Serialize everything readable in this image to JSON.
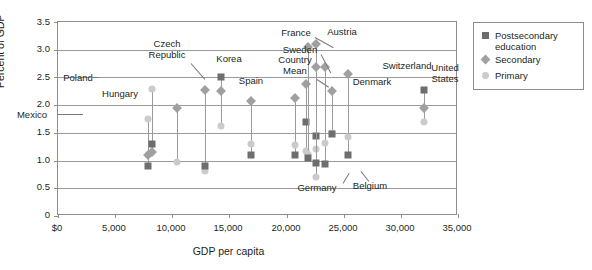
{
  "chart_data": {
    "type": "scatter",
    "title": "",
    "xlabel": "GDP per capita",
    "ylabel": "Percent of GDP",
    "xlim": [
      0,
      35000
    ],
    "ylim": [
      0,
      3.5
    ],
    "xticks": [
      "$0",
      "5,000",
      "10,000",
      "15,000",
      "20,000",
      "25,000",
      "30,000",
      "35,000"
    ],
    "xtick_values": [
      0,
      5000,
      10000,
      15000,
      20000,
      25000,
      30000,
      35000
    ],
    "yticks": [
      "0",
      "0.5",
      "1.0",
      "1.5",
      "2.0",
      "2.5",
      "3.0",
      "3.5"
    ],
    "ytick_values": [
      0,
      0.5,
      1.0,
      1.5,
      2.0,
      2.5,
      3.0,
      3.5
    ],
    "grid": true,
    "legend_position": "right",
    "series": [
      {
        "name": "Postsecondary education",
        "marker": "square",
        "color": "#6e6e6e"
      },
      {
        "name": "Secondary",
        "marker": "diamond",
        "color": "#a0a0a0"
      },
      {
        "name": "Primary",
        "marker": "circle",
        "color": "#cbcbcb"
      }
    ],
    "points": [
      {
        "country": "Mexico",
        "gdp": 7900,
        "primary": 1.75,
        "secondary": 1.1,
        "postsecondary": 0.9
      },
      {
        "country": "Poland",
        "gdp": 8200,
        "primary": 2.3,
        "secondary": 1.15,
        "postsecondary": 1.3
      },
      {
        "country": "Hungary",
        "gdp": 10400,
        "primary": 0.98,
        "secondary": 1.95,
        "postsecondary": null
      },
      {
        "country": "Czech Republic",
        "gdp": 12900,
        "primary": 0.82,
        "secondary": 2.27,
        "postsecondary": 0.9
      },
      {
        "country": "Korea",
        "gdp": 14300,
        "primary": 1.62,
        "secondary": 2.25,
        "postsecondary": 2.5
      },
      {
        "country": "Spain",
        "gdp": 16900,
        "primary": 1.3,
        "secondary": 2.08,
        "postsecondary": 1.1
      },
      {
        "country": "Country Mean",
        "gdp": 20700,
        "primary": 1.28,
        "secondary": 2.13,
        "postsecondary": 1.1
      },
      {
        "country": "Sweden",
        "gdp": 21700,
        "primary": 1.18,
        "secondary": 2.38,
        "postsecondary": 1.7
      },
      {
        "country": "France",
        "gdp": 21900,
        "primary": 1.12,
        "secondary": 3.05,
        "postsecondary": 1.05
      },
      {
        "country": "Austria",
        "gdp": 22600,
        "primary": 1.2,
        "secondary": 3.1,
        "postsecondary": 1.45
      },
      {
        "country": "Germany",
        "gdp": 22600,
        "primary": 0.7,
        "secondary": 2.68,
        "postsecondary": 0.95
      },
      {
        "country": "Belgium",
        "gdp": 23400,
        "primary": 1.32,
        "secondary": 2.68,
        "postsecondary": 0.93
      },
      {
        "country": "Denmark",
        "gdp": 24000,
        "primary": 1.5,
        "secondary": 2.25,
        "postsecondary": 1.48
      },
      {
        "country": "Switzerland",
        "gdp": 25400,
        "primary": 1.42,
        "secondary": 2.57,
        "postsecondary": 1.1
      },
      {
        "country": "United States",
        "gdp": 32000,
        "primary": 1.7,
        "secondary": 1.95,
        "postsecondary": 2.28
      }
    ],
    "annotations": [
      {
        "label": "Mexico",
        "x": 7900,
        "leader": true
      },
      {
        "label": "Poland",
        "x": 8200,
        "leader": true
      },
      {
        "label": "Hungary",
        "x": 10400,
        "leader": false
      },
      {
        "label": "Czech\nRepublic",
        "x": 12900,
        "leader": true
      },
      {
        "label": "Korea",
        "x": 14300,
        "leader": false
      },
      {
        "label": "Spain",
        "x": 16900,
        "leader": false
      },
      {
        "label": "Country\nMean",
        "x": 20700,
        "leader": true
      },
      {
        "label": "Sweden",
        "x": 21700,
        "leader": true
      },
      {
        "label": "France",
        "x": 21900,
        "leader": true
      },
      {
        "label": "Austria",
        "x": 22600,
        "leader": false
      },
      {
        "label": "Germany",
        "x": 22600,
        "leader": true
      },
      {
        "label": "Belgium",
        "x": 23400,
        "leader": true
      },
      {
        "label": "Denmark",
        "x": 24000,
        "leader": false
      },
      {
        "label": "Switzerland",
        "x": 25400,
        "leader": false
      },
      {
        "label": "United\nStates",
        "x": 32000,
        "leader": false
      }
    ]
  },
  "axes": {
    "y_title": "Percent of GDP",
    "x_title": "GDP per capita",
    "y_ticks": [
      "3.5",
      "3.0",
      "2.5",
      "2.0",
      "1.5",
      "1.0",
      "0.5",
      "0"
    ],
    "x_ticks": [
      "$0",
      "5,000",
      "10,000",
      "15,000",
      "20,000",
      "25,000",
      "30,000",
      "35,000"
    ]
  },
  "legend": {
    "items": [
      {
        "label": "Postsecondary\neducation",
        "marker": "square-marker",
        "color": "#6e6e6e"
      },
      {
        "label": "Secondary",
        "marker": "diamond-marker",
        "color": "#a0a0a0"
      },
      {
        "label": "Primary",
        "marker": "circle-marker",
        "color": "#cbcbcb"
      }
    ]
  },
  "labels": {
    "mexico": "Mexico",
    "poland": "Poland",
    "hungary": "Hungary",
    "czech_republic_l1": "Czech",
    "czech_republic_l2": "Republic",
    "korea": "Korea",
    "spain": "Spain",
    "country_mean_l1": "Country",
    "country_mean_l2": "Mean",
    "sweden": "Sweden",
    "france": "France",
    "austria": "Austria",
    "germany": "Germany",
    "belgium": "Belgium",
    "denmark": "Denmark",
    "switzerland": "Switzerland",
    "united_states_l1": "United",
    "united_states_l2": "States"
  }
}
